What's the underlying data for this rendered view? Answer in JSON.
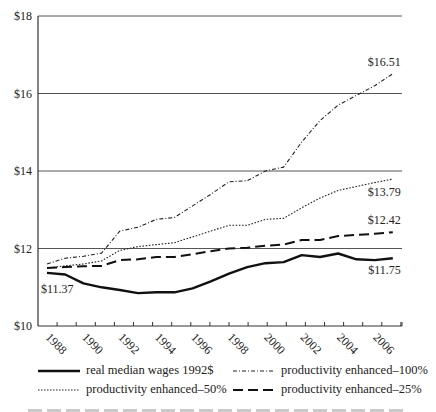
{
  "chart_data": {
    "type": "line",
    "title": "",
    "xlabel": "",
    "ylabel": "",
    "x": [
      1988,
      1989,
      1990,
      1991,
      1992,
      1993,
      1994,
      1995,
      1996,
      1997,
      1998,
      1999,
      2000,
      2001,
      2002,
      2003,
      2004,
      2005,
      2006,
      2007
    ],
    "xticks": [
      "1988",
      "1990",
      "1992",
      "1994",
      "1996",
      "1998",
      "2000",
      "2002",
      "2004",
      "2006"
    ],
    "yticks": [
      "$10",
      "$12",
      "$14",
      "$16",
      "$18"
    ],
    "ylim": [
      10,
      18
    ],
    "grid": "horizontal",
    "legend_position": "bottom",
    "series": [
      {
        "name": "real median wages 1992$",
        "style": "solid-thick",
        "values": [
          11.37,
          11.33,
          11.1,
          11.0,
          10.93,
          10.85,
          10.87,
          10.87,
          10.97,
          11.15,
          11.35,
          11.52,
          11.62,
          11.65,
          11.83,
          11.78,
          11.87,
          11.72,
          11.7,
          11.75
        ]
      },
      {
        "name": "productivity enhanced–100%",
        "style": "dash-dot",
        "values": [
          11.6,
          11.75,
          11.8,
          11.88,
          12.45,
          12.55,
          12.75,
          12.8,
          13.1,
          13.4,
          13.72,
          13.75,
          14.0,
          14.1,
          14.75,
          15.3,
          15.7,
          15.95,
          16.2,
          16.51
        ]
      },
      {
        "name": "productivity enhanced–50%",
        "style": "dotted",
        "values": [
          11.5,
          11.55,
          11.6,
          11.68,
          11.95,
          12.05,
          12.1,
          12.15,
          12.3,
          12.45,
          12.6,
          12.6,
          12.75,
          12.78,
          13.05,
          13.3,
          13.5,
          13.6,
          13.7,
          13.79
        ]
      },
      {
        "name": "productivity enhanced–25%",
        "style": "long-dash",
        "values": [
          11.5,
          11.52,
          11.54,
          11.55,
          11.7,
          11.72,
          11.78,
          11.78,
          11.85,
          11.93,
          12.0,
          12.02,
          12.07,
          12.1,
          12.22,
          12.22,
          12.32,
          12.35,
          12.38,
          12.42
        ]
      }
    ],
    "annotations": [
      {
        "text": "$11.37",
        "series": 0,
        "at": "start"
      },
      {
        "text": "$11.75",
        "series": 0,
        "at": "end"
      },
      {
        "text": "$16.51",
        "series": 1,
        "at": "end"
      },
      {
        "text": "$13.79",
        "series": 2,
        "at": "end"
      },
      {
        "text": "$12.42",
        "series": 3,
        "at": "end"
      }
    ]
  },
  "legend": {
    "items": [
      {
        "label": "real median wages 1992$"
      },
      {
        "label": "productivity enhanced–100%"
      },
      {
        "label": "productivity enhanced–50%"
      },
      {
        "label": "productivity enhanced–25%"
      }
    ]
  }
}
